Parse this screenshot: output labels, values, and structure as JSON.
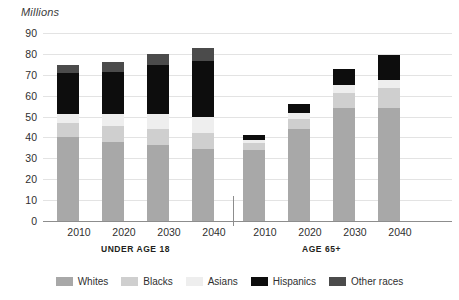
{
  "chart_data": {
    "type": "bar",
    "subtype": "stacked-bar-grouped",
    "title": "Millions",
    "xlabel": "",
    "ylabel": "Millions",
    "ylim": [
      0,
      90
    ],
    "ytick_step": 10,
    "yticks": [
      "90",
      "80",
      "70",
      "60",
      "50",
      "40",
      "30",
      "20",
      "10",
      "0"
    ],
    "grid": true,
    "legend_position": "bottom",
    "categories": [
      "2010",
      "2020",
      "2030",
      "2040"
    ],
    "groups": [
      {
        "label": "UNDER AGE 18",
        "categories": [
          "2010",
          "2020",
          "2030",
          "2040"
        ],
        "series": [
          {
            "name": "Whites",
            "values": [
              40.0,
              38.0,
              36.5,
              34.5
            ]
          },
          {
            "name": "Blacks",
            "values": [
              7.0,
              7.5,
              7.5,
              7.5
            ]
          },
          {
            "name": "Asians",
            "values": [
              4.0,
              5.5,
              7.0,
              8.0
            ]
          },
          {
            "name": "Hispanics",
            "values": [
              20.0,
              20.5,
              23.5,
              26.5
            ]
          },
          {
            "name": "Other races",
            "values": [
              3.5,
              4.5,
              5.5,
              6.5
            ]
          }
        ],
        "totals": [
          74.5,
          76.0,
          80.0,
          83.0
        ]
      },
      {
        "label": "AGE 65+",
        "categories": [
          "2010",
          "2020",
          "2030",
          "2040"
        ],
        "series": [
          {
            "name": "Whites",
            "values": [
              34.0,
              44.0,
              54.0,
              54.0
            ]
          },
          {
            "name": "Blacks",
            "values": [
              3.5,
              5.0,
              7.5,
              9.5
            ]
          },
          {
            "name": "Asians",
            "values": [
              1.5,
              2.5,
              3.5,
              4.0
            ]
          },
          {
            "name": "Hispanics",
            "values": [
              2.0,
              4.5,
              8.0,
              12.0
            ]
          },
          {
            "name": "Other races",
            "values": [
              0.0,
              0.0,
              0.0,
              0.0
            ]
          }
        ],
        "totals": [
          41.0,
          56.0,
          73.0,
          79.5
        ]
      }
    ],
    "legend": [
      {
        "name": "Whites",
        "color": "#a8a8a8"
      },
      {
        "name": "Blacks",
        "color": "#cfcfcf"
      },
      {
        "name": "Asians",
        "color": "#eeeeee"
      },
      {
        "name": "Hispanics",
        "color": "#0d0d0d"
      },
      {
        "name": "Other races",
        "color": "#4b4b4b"
      }
    ]
  }
}
